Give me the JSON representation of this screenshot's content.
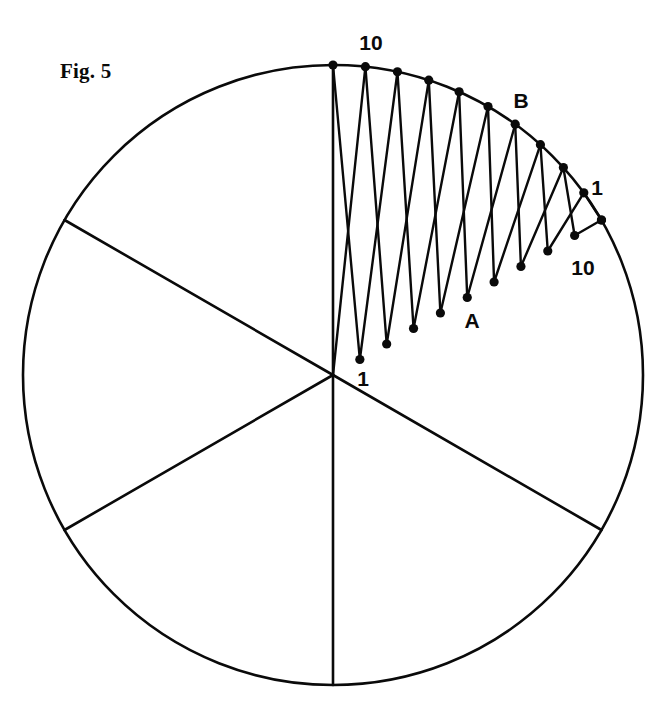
{
  "figure": {
    "caption": "Fig. 5",
    "caption_x": 60,
    "caption_y": 78,
    "background_color": "#ffffff",
    "ink_color": "#0a0a0a"
  },
  "labels": {
    "arc_start": "10",
    "arc_end": "1",
    "radius_start": "1",
    "radius_end": "10",
    "point_a": "A",
    "point_b": "B"
  },
  "label_positions": {
    "arc_start": {
      "x": 371,
      "y": 50,
      "anchor": "middle"
    },
    "arc_end": {
      "x": 597,
      "y": 195,
      "anchor": "middle"
    },
    "radius_start": {
      "x": 363,
      "y": 386,
      "anchor": "middle"
    },
    "radius_end": {
      "x": 583,
      "y": 275,
      "anchor": "middle"
    },
    "point_a": {
      "x": 472,
      "y": 328,
      "anchor": "middle"
    },
    "point_b": {
      "x": 521,
      "y": 108,
      "anchor": "middle"
    }
  },
  "chart_data": {
    "type": "diagram",
    "title": "Fig. 5",
    "circle": {
      "center_x": 333,
      "center_y": 375,
      "radius": 310,
      "stroke_width": 2.6
    },
    "radii_angles_deg": [
      90,
      150,
      210,
      270,
      330
    ],
    "divisions": 10,
    "arc": {
      "start_angle_deg": 90,
      "end_angle_deg": 30,
      "numbering_at_start": 10,
      "numbering_at_end": 1,
      "point_count": 11
    },
    "radius_ray": {
      "angle_deg": 30,
      "numbering_at_center": 1,
      "numbering_at_circle": 10,
      "point_count": 11
    },
    "chords": [
      {
        "index": 1,
        "arc_number": 10,
        "radius_number": 1
      },
      {
        "index": 2,
        "arc_number": 9,
        "radius_number": 2
      },
      {
        "index": 3,
        "arc_number": 8,
        "radius_number": 3
      },
      {
        "index": 4,
        "arc_number": 7,
        "radius_number": 4
      },
      {
        "index": 5,
        "arc_number": 6,
        "radius_number": 5
      },
      {
        "index": 6,
        "arc_number": 5,
        "radius_number": 6
      },
      {
        "index": 7,
        "arc_number": 4,
        "radius_number": 7
      },
      {
        "index": 8,
        "arc_number": 3,
        "radius_number": 8
      },
      {
        "index": 9,
        "arc_number": 2,
        "radius_number": 9
      },
      {
        "index": 10,
        "arc_number": 1,
        "radius_number": 10
      }
    ],
    "node_dot_radius": 4.6,
    "marked_points": [
      {
        "label": "A",
        "on": "radius",
        "number": 4
      },
      {
        "label": "B",
        "on": "arc",
        "number": 4
      }
    ]
  }
}
